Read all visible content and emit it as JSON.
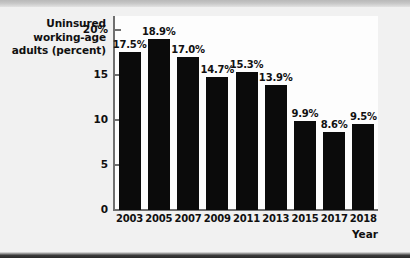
{
  "chart_data": {
    "type": "bar",
    "title": "Uninsured working-age adults (percent)",
    "title_lines": [
      "Uninsured",
      "working-age",
      "adults (percent)"
    ],
    "xlabel": "Year",
    "ylabel": "Uninsured working-age adults (percent)",
    "categories": [
      "2003",
      "2005",
      "2007",
      "2009",
      "2011",
      "2013",
      "2015",
      "2017",
      "2018"
    ],
    "values": [
      17.5,
      18.9,
      17.0,
      14.7,
      15.3,
      13.9,
      9.9,
      8.6,
      9.5
    ],
    "value_labels": [
      "17.5%",
      "18.9%",
      "17.0%",
      "14.7%",
      "15.3%",
      "13.9%",
      "9.9%",
      "8.6%",
      "9.5%"
    ],
    "ylim": [
      0,
      21.5
    ],
    "yticks": [
      0,
      5,
      10,
      15,
      20
    ],
    "ytick_labels": [
      "0",
      "5",
      "10",
      "15",
      "20%"
    ],
    "grid": false,
    "legend": null,
    "bar_color": "#0b0b0b",
    "axis_color": "#6f6f6f",
    "text_color": "#101010",
    "plot_background": "#fdfdfd",
    "page_background": "#f1f1f1"
  }
}
